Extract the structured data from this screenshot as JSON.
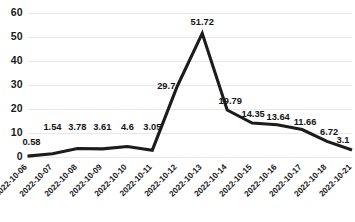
{
  "chart_data": {
    "type": "line",
    "title": "",
    "subtitle": "",
    "xlabel": "",
    "ylabel": "",
    "categories": [
      "2022-10-06",
      "2022-10-07",
      "2022-10-08",
      "2022-10-09",
      "2022-10-10",
      "2022-10-11",
      "2022-10-12",
      "2022-10-13",
      "2022-10-14",
      "2022-10-15",
      "2022-10-16",
      "2022-10-17",
      "2022-10-18",
      "2022-10-21"
    ],
    "values": [
      0.58,
      1.54,
      3.78,
      3.61,
      4.6,
      3.05,
      29.7,
      51.72,
      19.79,
      14.35,
      13.64,
      11.66,
      6.72,
      3.1
    ],
    "point_labels": [
      "0.58",
      "1.54",
      "3.78",
      "3.61",
      "4.6",
      "3.05",
      "29.7",
      "51.72",
      "19.79",
      "14.35",
      "13.64",
      "11.66",
      "6.72",
      "3.1"
    ],
    "ylim": [
      0,
      60
    ],
    "yticks": [
      0,
      10,
      20,
      30,
      40,
      50,
      60
    ],
    "ytick_labels": [
      "0",
      "10",
      "20",
      "30",
      "40",
      "50",
      "60"
    ],
    "grid": "horizontal",
    "legend": "none",
    "series": [
      {
        "name": "",
        "values": [
          0.58,
          1.54,
          3.78,
          3.61,
          4.6,
          3.05,
          29.7,
          51.72,
          19.79,
          14.35,
          13.64,
          11.66,
          6.72,
          3.1
        ],
        "color": "#1c1c1c"
      }
    ],
    "colors": {
      "line": "#1c1c1c",
      "grid": "#e8e8e8",
      "text": "#1a1a1a",
      "background": "#ffffff"
    },
    "xtick_rotation": -45
  }
}
